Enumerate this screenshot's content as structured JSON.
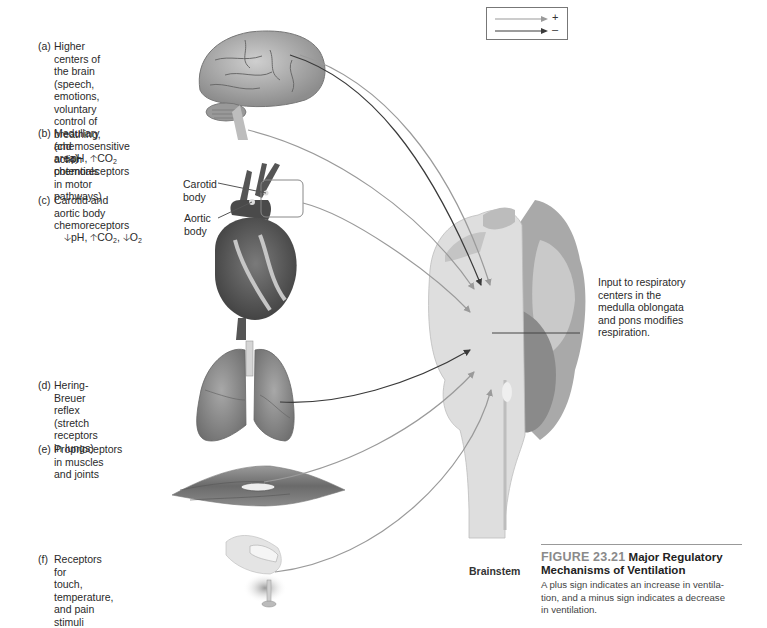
{
  "figure": {
    "number": "FIGURE 23.21",
    "title_line1": "Major Regulatory",
    "title_line2": "Mechanisms of Ventilation",
    "description": "A plus sign indicates an increase in ventila-\ntion, and a minus sign indicates a decrease\nin ventilation."
  },
  "legend": {
    "items": [
      {
        "symbol": "+",
        "meaning": "increase in ventilation",
        "color": "#9a9a9a"
      },
      {
        "symbol": "–",
        "meaning": "decrease in ventilation",
        "color": "#3a3a3a"
      }
    ]
  },
  "inputs": [
    {
      "tag": "(a)",
      "text": "Higher centers of\nthe brain (speech,\nemotions, voluntary\ncontrol of breathing,\nand action potentials\nin motor pathways)",
      "image": "brain"
    },
    {
      "tag": "(b)",
      "text": "Medullary (chemosensitive\narea) chemoreceptors",
      "image": "brain-medulla",
      "chem": [
        {
          "dir": "down",
          "label": "pH"
        },
        {
          "dir": "up",
          "label": "CO",
          "sub": "2"
        }
      ]
    },
    {
      "tag": "(c)",
      "text": "Carotid and\naortic body\nchemoreceptors",
      "image": "heart",
      "chem": [
        {
          "dir": "down",
          "label": "pH"
        },
        {
          "dir": "up",
          "label": "CO",
          "sub": "2"
        },
        {
          "dir": "down",
          "label": "O",
          "sub": "2"
        }
      ]
    },
    {
      "tag": "(d)",
      "text": "Hering-Breuer reflex\n(stretch receptors\nin lungs)",
      "image": "lungs"
    },
    {
      "tag": "(e)",
      "text": "Proprioceptors\nin muscles\nand joints",
      "image": "muscle"
    },
    {
      "tag": "(f)",
      "text": "Receptors for\ntouch, temperature,\nand pain stimuli",
      "image": "finger"
    }
  ],
  "heart_labels": {
    "carotid": "Carotid\nbody",
    "aortic": "Aortic\nbody"
  },
  "output_label": "Input to respiratory\ncenters in the\nmedulla oblongata\nand pons modifies\nrespiration.",
  "brainstem_label": "Brainstem",
  "colors": {
    "plus_arrow": "#9a9a9a",
    "minus_arrow": "#3a3a3a",
    "figure_number": "#8a8a8a"
  }
}
